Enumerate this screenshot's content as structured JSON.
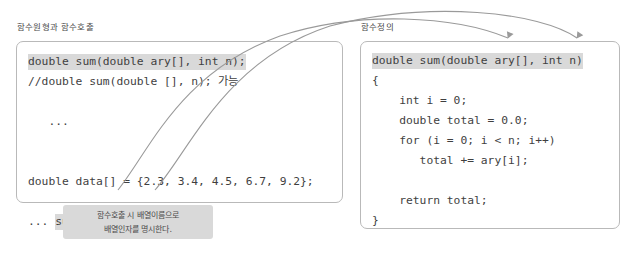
{
  "panels": {
    "left": {
      "caption": "함수원형과 함수호출",
      "lines": [
        {
          "id": "proto",
          "segments": [
            {
              "text": "double sum(double ary[], int n);",
              "style": "highlight"
            }
          ]
        },
        {
          "id": "proto-alt",
          "segments": [
            {
              "text": "//double sum(double [], n); 가능",
              "style": "plain"
            }
          ]
        },
        {
          "id": "blank1",
          "segments": [
            {
              "text": "",
              "style": "plain"
            }
          ]
        },
        {
          "id": "ellipsis-top",
          "segments": [
            {
              "text": "   ...",
              "style": "plain"
            }
          ]
        },
        {
          "id": "blank2",
          "segments": [
            {
              "text": "",
              "style": "plain"
            }
          ]
        },
        {
          "id": "blank3",
          "segments": [
            {
              "text": "",
              "style": "plain"
            }
          ]
        },
        {
          "id": "array-decl",
          "segments": [
            {
              "text": "double data[] = {2.3, 3.4, 4.5, 6.7, 9.2};",
              "style": "plain"
            }
          ]
        },
        {
          "id": "blank4",
          "segments": [
            {
              "text": "",
              "style": "plain"
            }
          ]
        },
        {
          "id": "call",
          "segments": [
            {
              "text": "... ",
              "style": "plain"
            },
            {
              "text": "sum(",
              "style": "highlight"
            },
            {
              "text": "data",
              "style": "boxed"
            },
            {
              "text": ", 5);",
              "style": "highlight"
            }
          ]
        }
      ]
    },
    "right": {
      "caption": "함수정의",
      "lines": [
        {
          "id": "signature",
          "segments": [
            {
              "text": "double sum(double ary[], int n)",
              "style": "highlight"
            }
          ]
        },
        {
          "id": "open-brace",
          "segments": [
            {
              "text": "{",
              "style": "plain"
            }
          ]
        },
        {
          "id": "decl-i",
          "segments": [
            {
              "text": "    int i = 0;",
              "style": "plain"
            }
          ]
        },
        {
          "id": "decl-total",
          "segments": [
            {
              "text": "    double total = 0.0;",
              "style": "plain"
            }
          ]
        },
        {
          "id": "for-loop",
          "segments": [
            {
              "text": "    for (i = 0; i < n; i++)",
              "style": "plain"
            }
          ]
        },
        {
          "id": "accumulate",
          "segments": [
            {
              "text": "       total += ary[i];",
              "style": "plain"
            }
          ]
        },
        {
          "id": "blank1",
          "segments": [
            {
              "text": "",
              "style": "plain"
            }
          ]
        },
        {
          "id": "return",
          "segments": [
            {
              "text": "    return total;",
              "style": "plain"
            }
          ]
        },
        {
          "id": "close-brace",
          "segments": [
            {
              "text": "}",
              "style": "plain"
            }
          ]
        }
      ]
    }
  },
  "callout": {
    "line1": "함수호출 시 배열이름으로",
    "line2": "배열인자를 명시한다."
  },
  "arrows": [
    {
      "id": "array-arg-arrow",
      "label": "data to ary[]"
    },
    {
      "id": "count-arg-arrow",
      "label": "5 to int n"
    }
  ],
  "colors": {
    "highlight": "#d9d9d9",
    "panel_border": "#b9b9b9",
    "arrow": "#9a9a9a",
    "text": "#3f3f3f"
  }
}
